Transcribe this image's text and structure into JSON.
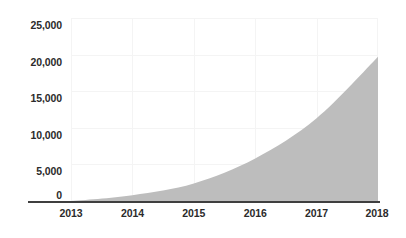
{
  "chart_data": {
    "type": "area",
    "title": "",
    "subtitle": "",
    "xlabel": "",
    "ylabel": "",
    "categories": [
      "2013",
      "2014",
      "2015",
      "2016",
      "2017",
      "2018"
    ],
    "x": [
      2013,
      2014,
      2015,
      2016,
      2017,
      2018
    ],
    "values": [
      0,
      800,
      2400,
      5800,
      11300,
      19700
    ],
    "series": [
      {
        "name": "",
        "values": [
          0,
          800,
          2400,
          5800,
          11300,
          19700
        ]
      }
    ],
    "xlim": [
      2013,
      2018
    ],
    "ylim": [
      0,
      25000
    ],
    "y_ticks": [
      0,
      5000,
      10000,
      15000,
      20000,
      25000
    ],
    "y_tick_labels": [
      "0",
      "5,000",
      "10,000",
      "15,000",
      "20,000",
      "25,000"
    ],
    "x_ticks": [
      2013,
      2014,
      2015,
      2016,
      2017,
      2018
    ],
    "x_tick_labels": [
      "2013",
      "2014",
      "2015",
      "2016",
      "2017",
      "2018"
    ],
    "grid": true,
    "legend": false,
    "legend_position": "none",
    "annotations": [],
    "colors": {
      "area_fill": "#bdbdbd",
      "axis_line": "#3f3f3f",
      "gridline": "#f4f4f4",
      "tick_label": "#2b2b2b",
      "background": "#ffffff"
    }
  }
}
